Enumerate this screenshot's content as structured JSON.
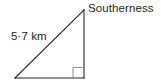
{
  "diagram": {
    "type": "right-triangle",
    "background_color": "#ffffff",
    "stroke_color": "#231f20",
    "right_angle_marker_color": "#8c8c8c",
    "text_color": "#231f20",
    "labels": {
      "vertex_top": "Southerness",
      "hypotenuse_length": "5·7 km"
    },
    "measurements": {
      "hypotenuse_value": "5·7",
      "hypotenuse_units": "km"
    },
    "geometry": {
      "apex": {
        "x": 84,
        "y": 10
      },
      "bottom_right": {
        "x": 84,
        "y": 78
      },
      "bottom_left": {
        "x": 15,
        "y": 78
      },
      "right_angle_at": "bottom_right",
      "right_angle_marker_size": 10
    },
    "icon_names": {
      "right_angle": "right-angle-marker-icon"
    }
  }
}
